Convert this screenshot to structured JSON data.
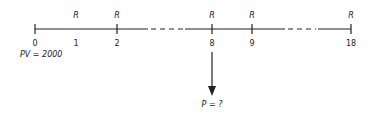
{
  "diagram": {
    "type": "cash-flow-timeline",
    "periods": [
      {
        "label": "0",
        "x": 35,
        "payment": "",
        "tick": true
      },
      {
        "label": "1",
        "x": 76,
        "payment": "R",
        "tick": false
      },
      {
        "label": "2",
        "x": 117,
        "payment": "R",
        "tick": true
      },
      {
        "label": "8",
        "x": 212,
        "payment": "R",
        "tick": true
      },
      {
        "label": "9",
        "x": 252,
        "payment": "R",
        "tick": true
      },
      {
        "label": "18",
        "x": 351,
        "payment": "R",
        "tick": true
      }
    ],
    "present_value_label": "PV = 2000",
    "unknown_label": "P = ?",
    "arrow_at_period": "8",
    "colors": {
      "line": "#222222",
      "text": "#222222"
    }
  }
}
